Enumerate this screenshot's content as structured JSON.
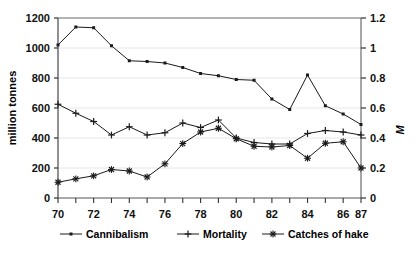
{
  "chart_data": {
    "type": "line",
    "title": "",
    "xlabel": "",
    "ylabel": "million tonnes",
    "y2label": "M",
    "xlim": [
      70,
      87
    ],
    "ylim": [
      0,
      1200
    ],
    "y2lim": [
      0,
      1.2
    ],
    "grid": true,
    "legend_position": "bottom",
    "x": [
      70,
      71,
      72,
      73,
      74,
      75,
      76,
      77,
      78,
      79,
      80,
      81,
      82,
      83,
      84,
      85,
      86,
      87
    ],
    "xticks": [
      70,
      72,
      74,
      76,
      78,
      80,
      82,
      84,
      86,
      87
    ],
    "xticklabels": [
      "70",
      "72",
      "74",
      "76",
      "78",
      "80",
      "82",
      "84",
      "86",
      "87"
    ],
    "yticks": [
      0,
      200,
      400,
      600,
      800,
      1000,
      1200
    ],
    "yticklabels": [
      "0",
      "200",
      "400",
      "600",
      "800",
      "1000",
      "1200"
    ],
    "y2ticks": [
      0,
      0.2,
      0.4,
      0.6,
      0.8,
      1,
      1.2
    ],
    "y2ticklabels": [
      "0",
      "0.2",
      "0.4",
      "0.6",
      "0.8",
      "1",
      "1.2"
    ],
    "series": [
      {
        "name": "Cannibalism",
        "marker": "dot",
        "axis": "left",
        "values": [
          1020,
          1140,
          1135,
          1015,
          915,
          910,
          900,
          870,
          830,
          815,
          790,
          785,
          660,
          590,
          820,
          615,
          560,
          490
        ]
      },
      {
        "name": "Mortality",
        "marker": "plus",
        "axis": "left",
        "values": [
          625,
          565,
          510,
          420,
          475,
          420,
          435,
          500,
          470,
          520,
          400,
          370,
          360,
          360,
          430,
          450,
          440,
          420
        ]
      },
      {
        "name": "Catches of hake",
        "marker": "star",
        "axis": "left",
        "values": [
          105,
          128,
          148,
          190,
          180,
          140,
          228,
          363,
          440,
          465,
          395,
          345,
          340,
          350,
          265,
          365,
          375,
          200
        ]
      }
    ]
  },
  "legend": {
    "items": [
      {
        "label": "Cannibalism",
        "marker": "dot"
      },
      {
        "label": "Mortality",
        "marker": "plus"
      },
      {
        "label": "Catches of hake",
        "marker": "star"
      }
    ]
  },
  "axes": {
    "left_title": "million tonnes",
    "right_title": "M"
  }
}
